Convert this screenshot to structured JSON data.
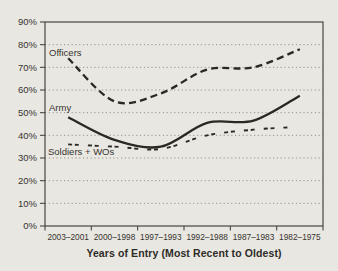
{
  "chart_data": {
    "type": "line",
    "title": "",
    "xlabel": "Years of Entry (Most Recent to Oldest)",
    "ylabel": "",
    "ylim": [
      0,
      90
    ],
    "ytick_step": 10,
    "ytick_labels": [
      "0%",
      "10%",
      "20%",
      "30%",
      "40%",
      "50%",
      "60%",
      "70%",
      "80%",
      "90%"
    ],
    "grid": "horizontal-dotted",
    "legend_position": "inline-labels-on-plot",
    "categories": [
      "2003–2001",
      "2000–1998",
      "1997–1993",
      "1992–1988",
      "1987–1983",
      "1982–1975"
    ],
    "series": [
      {
        "name": "Officers",
        "line_style": "dashed",
        "values": [
          74,
          55,
          58.5,
          69,
          70,
          78
        ]
      },
      {
        "name": "Army",
        "line_style": "solid",
        "values": [
          48,
          38,
          35,
          45.5,
          46.5,
          57.5
        ]
      },
      {
        "name": "Soldiers + WOs",
        "line_style": "short-dashed",
        "values": [
          36,
          35,
          34,
          40,
          42.5,
          43.5
        ]
      }
    ]
  },
  "colors": {
    "background": "#e9e7e2",
    "ink": "#2b2823",
    "border": "#4a473f",
    "grid": "#96938a",
    "text": "#36342e"
  }
}
